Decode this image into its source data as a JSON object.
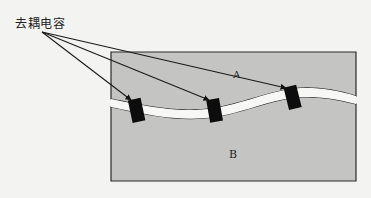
{
  "diagram": {
    "callout_label": "去耦电容",
    "region_a_label": "A",
    "region_b_label": "B",
    "colors": {
      "background": "#f3f3f1",
      "plane_fill": "#c4c4c2",
      "gap_fill": "#f7f7f5",
      "outline": "#2a2a2a",
      "capacitor": "#0d0d0d",
      "arrow": "#1a1a1a"
    },
    "capacitors": [
      {
        "id": 1,
        "x": 136,
        "y": 118
      },
      {
        "id": 2,
        "x": 214,
        "y": 117
      },
      {
        "id": 3,
        "x": 291,
        "y": 105
      }
    ]
  }
}
